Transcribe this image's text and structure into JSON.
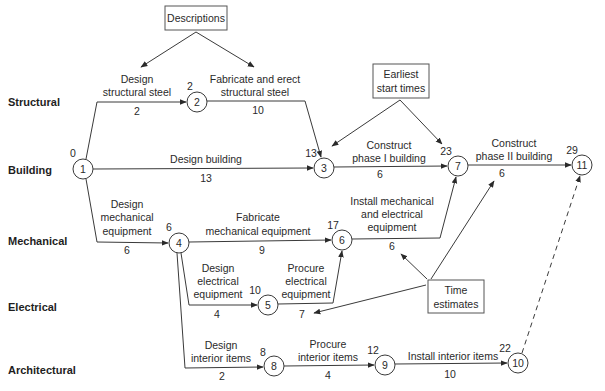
{
  "rows": [
    "Structural",
    "Building",
    "Mechanical",
    "Electrical",
    "Architectural"
  ],
  "callouts": {
    "descriptions": "Descriptions",
    "earliest": [
      "Earliest",
      "start times"
    ],
    "time_estimates": [
      "Time",
      "estimates"
    ]
  },
  "nodes": [
    {
      "id": "1",
      "earliest_start": "0"
    },
    {
      "id": "2",
      "earliest_start": "2"
    },
    {
      "id": "3",
      "earliest_start": "13"
    },
    {
      "id": "4",
      "earliest_start": "6"
    },
    {
      "id": "5",
      "earliest_start": "10"
    },
    {
      "id": "6",
      "earliest_start": "17"
    },
    {
      "id": "7",
      "earliest_start": "23"
    },
    {
      "id": "8",
      "earliest_start": "8"
    },
    {
      "id": "9",
      "earliest_start": "12"
    },
    {
      "id": "10",
      "earliest_start": "22"
    },
    {
      "id": "11",
      "earliest_start": "29"
    }
  ],
  "activities": [
    {
      "from": "1",
      "to": "2",
      "label": [
        "Design",
        "structural steel"
      ],
      "duration": "2"
    },
    {
      "from": "2",
      "to": "3",
      "label": [
        "Fabricate and erect",
        "structural steel"
      ],
      "duration": "10"
    },
    {
      "from": "1",
      "to": "3",
      "label": [
        "Design building"
      ],
      "duration": "13"
    },
    {
      "from": "1",
      "to": "4",
      "label": [
        "Design",
        "mechanical",
        "equipment"
      ],
      "duration": "6"
    },
    {
      "from": "3",
      "to": "7",
      "label": [
        "Construct",
        "phase I building"
      ],
      "duration": "6"
    },
    {
      "from": "7",
      "to": "11",
      "label": [
        "Construct",
        "phase II building"
      ],
      "duration": "6"
    },
    {
      "from": "4",
      "to": "6",
      "label": [
        "Fabricate",
        "mechanical equipment"
      ],
      "duration": "9"
    },
    {
      "from": "6",
      "to": "7",
      "label": [
        "Install mechanical",
        "and electrical",
        "equipment"
      ],
      "duration": "6"
    },
    {
      "from": "4",
      "to": "5",
      "label": [
        "Design",
        "electrical",
        "equipment"
      ],
      "duration": "4"
    },
    {
      "from": "5",
      "to": "6",
      "label": [
        "Procure",
        "electrical",
        "equipment"
      ],
      "duration": "7"
    },
    {
      "from": "4",
      "to": "8",
      "label": [
        "Design",
        "interior items"
      ],
      "duration": "2"
    },
    {
      "from": "8",
      "to": "9",
      "label": [
        "Procure",
        "interior items"
      ],
      "duration": "4"
    },
    {
      "from": "9",
      "to": "10",
      "label": [
        "Install interior items"
      ],
      "duration": "10"
    },
    {
      "from": "10",
      "to": "11",
      "label": [],
      "duration": "",
      "dummy": true
    }
  ]
}
